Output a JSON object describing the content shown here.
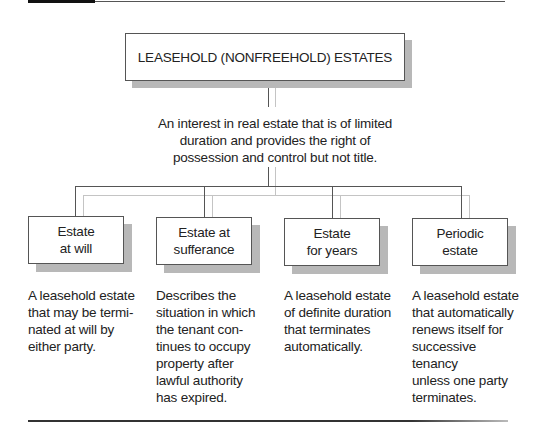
{
  "diagram": {
    "title": "LEASEHOLD (NONFREEHOLD) ESTATES",
    "definition": "An interest in real estate that is of limited duration and provides the right of possession and control but not title.",
    "types": [
      {
        "label": "Estate\nat will",
        "description": "A leasehold estate\nthat may be termi-\nnated at will by\neither party."
      },
      {
        "label": "Estate at\nsufferance",
        "description": "Describes the\nsituation in which\nthe tenant con-\ntinues to occupy\nproperty after\nlawful authority\nhas expired."
      },
      {
        "label": "Estate\nfor years",
        "description": "A leasehold estate\nof definite duration\nthat terminates\nautomatically."
      },
      {
        "label": "Periodic\nestate",
        "description": "A leasehold estate\nthat automatically\nrenews itself for\nsuccessive tenancy\nunless one party\nterminates."
      }
    ]
  },
  "colors": {
    "line_dark": "#555555",
    "line_light": "#c4c4c4",
    "shadow": "#b8b8b8",
    "border": "#555555"
  }
}
